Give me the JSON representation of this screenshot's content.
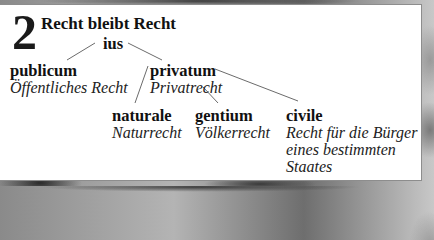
{
  "header": {
    "number": "2",
    "title": "Recht bleibt Recht"
  },
  "tree": {
    "root": {
      "latin": "ius"
    },
    "publicum": {
      "latin": "publicum",
      "german": "Öffentliches Recht"
    },
    "privatum": {
      "latin": "privatum",
      "german": "Privatrecht"
    },
    "naturale": {
      "latin": "naturale",
      "german": "Naturrecht"
    },
    "gentium": {
      "latin": "gentium",
      "german": "Völkerrecht"
    },
    "civile": {
      "latin": "civile",
      "german_lines": [
        "Recht für die Bürger",
        "eines bestimmten",
        "Staates"
      ]
    }
  },
  "edges": [
    {
      "from": "ius",
      "to": "publicum"
    },
    {
      "from": "ius",
      "to": "privatum"
    },
    {
      "from": "privatum",
      "to": "naturale"
    },
    {
      "from": "privatum",
      "to": "gentium"
    },
    {
      "from": "privatum",
      "to": "civile"
    }
  ],
  "colors": {
    "card_background": "#ffffff",
    "card_border": "#8d8d8d",
    "text": "#111111",
    "connector": "#6b6b6b"
  }
}
